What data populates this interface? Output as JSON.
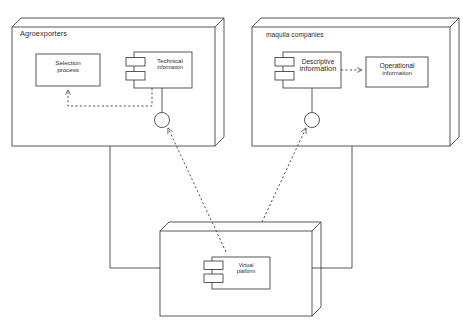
{
  "diagram": {
    "type": "uml-component-diagram",
    "background_color": "#ffffff",
    "stroke_color": "#3a3a3a",
    "text_color": "#2b2b2b"
  },
  "nodes": [
    {
      "id": "agroexporters",
      "label": "Agroexporters",
      "shape": "3d-box",
      "x": 12,
      "y": 18,
      "width": 203,
      "height": 128,
      "depth": 9
    },
    {
      "id": "maquila-companies",
      "label": "maquila companies",
      "shape": "3d-box",
      "x": 252,
      "y": 18,
      "width": 198,
      "height": 128,
      "depth": 9
    },
    {
      "id": "virtual-platform-node",
      "label": "",
      "shape": "3d-box",
      "x": 160,
      "y": 222,
      "width": 152,
      "height": 94,
      "depth": 9
    }
  ],
  "components": [
    {
      "id": "selection-process",
      "line1": "Selection",
      "line2": "process",
      "style": "plain-box",
      "x": 36,
      "y": 54,
      "width": 64,
      "height": 32
    },
    {
      "id": "technical-information",
      "line1": "Technical",
      "line2": "information",
      "style": "uml-component",
      "x": 134,
      "y": 52,
      "width": 58,
      "height": 36
    },
    {
      "id": "descriptive-information",
      "line1": "Descriptive",
      "line2": "information",
      "style": "uml-component",
      "x": 283,
      "y": 52,
      "width": 58,
      "height": 36
    },
    {
      "id": "operational-information",
      "line1": "Operational",
      "line2": "information",
      "style": "plain-box",
      "x": 366,
      "y": 57,
      "width": 62,
      "height": 30
    },
    {
      "id": "virtual-platform",
      "line1": "Virtual",
      "line2": "platform",
      "style": "uml-component",
      "x": 212,
      "y": 257,
      "width": 58,
      "height": 32
    }
  ],
  "interfaces": [
    {
      "id": "agroexporters-provided-interface",
      "type": "lollipop",
      "cx": 162,
      "cy": 120,
      "r": 7.5,
      "stem_from_x": 162,
      "stem_from_y": 88
    },
    {
      "id": "maquila-provided-interface",
      "type": "lollipop",
      "cx": 312,
      "cy": 120,
      "r": 7.5,
      "stem_from_x": 312,
      "stem_from_y": 88
    }
  ],
  "connections": [
    {
      "id": "technical-to-selection",
      "style": "dashed-dependency",
      "from": "technical-information",
      "to": "selection-process",
      "arrowhead": "open"
    },
    {
      "id": "descriptive-to-operational",
      "style": "dashed-dependency",
      "from": "descriptive-information",
      "to": "operational-information",
      "arrowhead": "open"
    },
    {
      "id": "platform-to-agroexporters-interface",
      "style": "dashed-dependency",
      "from": "virtual-platform-node",
      "to": "agroexporters-provided-interface",
      "arrowhead": "open"
    },
    {
      "id": "platform-to-maquila-interface",
      "style": "dashed-dependency",
      "from": "virtual-platform-node",
      "to": "maquila-provided-interface",
      "arrowhead": "open"
    },
    {
      "id": "agroexporters-to-platform-association",
      "style": "solid-association",
      "from": "agroexporters",
      "to": "virtual-platform-node",
      "arrowhead": "none"
    },
    {
      "id": "maquila-to-platform-association",
      "style": "solid-association",
      "from": "maquila-companies",
      "to": "virtual-platform-node",
      "arrowhead": "none"
    }
  ]
}
